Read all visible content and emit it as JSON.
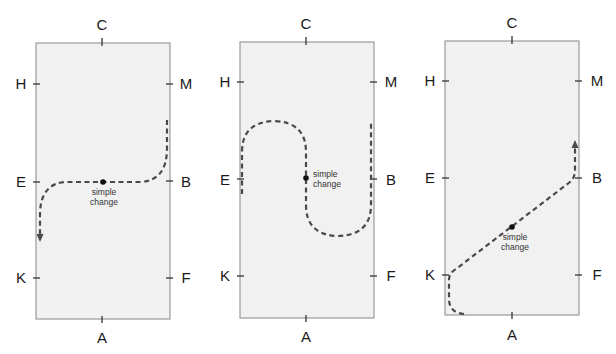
{
  "diagrams": [
    {
      "id": "arena-1",
      "markers": {
        "top": "C",
        "bottom": "A",
        "left_upper": "H",
        "left_middle": "E",
        "left_lower": "K",
        "right_upper": "M",
        "right_middle": "B",
        "right_lower": "F"
      },
      "annotation_line1": "simple",
      "annotation_line2": "change",
      "description": "Path comes down from near M on right track, curves across centre line E-B through the centre point, then curves down the left track toward K"
    },
    {
      "id": "arena-2",
      "markers": {
        "top": "C",
        "bottom": "A",
        "left_upper": "H",
        "left_middle": "E",
        "left_lower": "K",
        "right_upper": "M",
        "right_middle": "B",
        "right_lower": "F"
      },
      "annotation_line1": "simple",
      "annotation_line2": "change",
      "description": "Serpentine: half circle between E and centre line, simple change at centre, half circle down to right track at B"
    },
    {
      "id": "arena-3",
      "markers": {
        "top": "C",
        "bottom": "A",
        "left_upper": "H",
        "left_middle": "E",
        "left_lower": "K",
        "right_upper": "M",
        "right_middle": "B",
        "right_lower": "F"
      },
      "annotation_line1": "simple",
      "annotation_line2": "change",
      "description": "Path from near A corner up to K, diagonal change of rein K to B through the centre, then up the right track toward M"
    }
  ],
  "colors": {
    "arena_fill": "#f1f1f1",
    "arena_border": "#9a9a9a",
    "path": "#4a4a4a",
    "text": "#1a1a1a"
  }
}
